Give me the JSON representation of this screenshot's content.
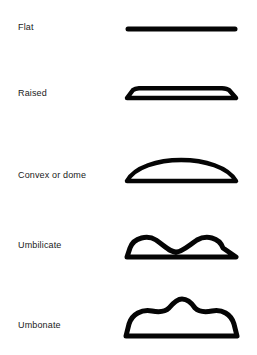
{
  "figure": {
    "background_color": "#ffffff",
    "stroke_color": "#050505",
    "label_color": "#1a1a1a"
  },
  "rows": [
    {
      "id": "flat",
      "label": "Flat",
      "shape_name": "flat-profile",
      "description": "A straight horizontal line with no elevation",
      "stroke_width": 5
    },
    {
      "id": "raised",
      "label": "Raised",
      "shape_name": "raised-profile",
      "description": "Low flat-topped plateau with slightly sloping sides",
      "stroke_width": 4.5
    },
    {
      "id": "convex",
      "label": "Convex or dome",
      "shape_name": "convex-dome-profile",
      "description": "Smooth rounded dome rising from a flat base",
      "stroke_width": 4.5
    },
    {
      "id": "umbilicate",
      "label": "Umbilicate",
      "shape_name": "umbilicate-profile",
      "description": "Two rounded humps with a central depression",
      "stroke_width": 5
    },
    {
      "id": "umbonate",
      "label": "Umbonate",
      "shape_name": "umbonate-profile",
      "description": "Broad raised base with a central raised knob (umbo)",
      "stroke_width": 5
    }
  ]
}
